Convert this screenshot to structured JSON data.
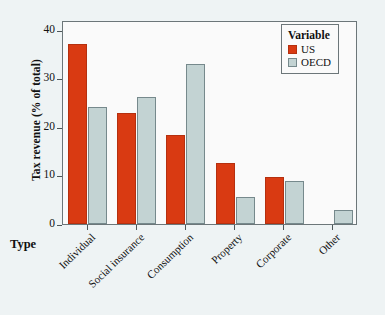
{
  "chart_data": {
    "type": "bar",
    "title": "",
    "xlabel": "Type",
    "ylabel": "Tax revenue (% of total)",
    "categories": [
      "Individual",
      "Social insurance",
      "Consumption",
      "Property",
      "Corporate",
      "Other"
    ],
    "series": [
      {
        "name": "US",
        "color": "#d93a12",
        "values": [
          37.0,
          22.9,
          18.3,
          12.5,
          9.6,
          0
        ]
      },
      {
        "name": "OECD",
        "color": "#c3d3d3",
        "values": [
          24.1,
          26.1,
          33.0,
          5.6,
          8.9,
          2.8
        ]
      }
    ],
    "ylim": [
      0,
      42
    ],
    "yticks": [
      0,
      10,
      20,
      30,
      40
    ],
    "ytick_labels": [
      "0",
      "10",
      "20",
      "30",
      "40"
    ],
    "grid": false,
    "legend": {
      "title": "Variable",
      "position": "top-right",
      "entries": [
        "US",
        "OECD"
      ]
    }
  },
  "colors": {
    "us": "#d93a12",
    "oecd": "#c3d3d3",
    "panel_background": "#fafafa",
    "page_background": "#eef3f4",
    "axis": "#4d5658"
  }
}
